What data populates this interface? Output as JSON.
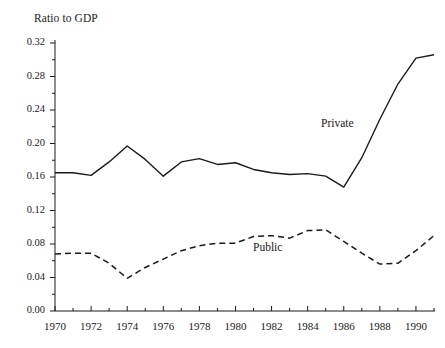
{
  "chart_data": {
    "type": "line",
    "title": "Ratio to GDP",
    "xlabel": "",
    "ylabel": "Ratio to GDP",
    "xlim": [
      1970,
      1991
    ],
    "ylim": [
      0.0,
      0.32
    ],
    "grid": false,
    "legend_position": "inline-annotations",
    "y_ticks": [
      "0.00",
      "0.04",
      "0.08",
      "0.12",
      "0.16",
      "0.20",
      "0.24",
      "0.28",
      "0.32"
    ],
    "y_tick_values": [
      0.0,
      0.04,
      0.08,
      0.12,
      0.16,
      0.2,
      0.24,
      0.28,
      0.32
    ],
    "y_minor_ticks": [
      0.02,
      0.06,
      0.1,
      0.14,
      0.18,
      0.22,
      0.26,
      0.3
    ],
    "x_ticks": [
      "1970",
      "1972",
      "1974",
      "1976",
      "1978",
      "1980",
      "1982",
      "1984",
      "1986",
      "1988",
      "1990"
    ],
    "x_tick_values": [
      1970,
      1972,
      1974,
      1976,
      1978,
      1980,
      1982,
      1984,
      1986,
      1988,
      1990
    ],
    "x_minor_ticks": [
      1971,
      1973,
      1975,
      1977,
      1979,
      1981,
      1983,
      1985,
      1987,
      1989,
      1991
    ],
    "x": [
      1970,
      1971,
      1972,
      1973,
      1974,
      1975,
      1976,
      1977,
      1978,
      1979,
      1980,
      1981,
      1982,
      1983,
      1984,
      1985,
      1986,
      1987,
      1988,
      1989,
      1990,
      1991
    ],
    "series": [
      {
        "name": "Private",
        "style": "solid",
        "color": "#1a1a1a",
        "annotation": "Private",
        "values": [
          0.165,
          0.165,
          0.162,
          0.178,
          0.197,
          0.181,
          0.161,
          0.178,
          0.182,
          0.175,
          0.177,
          0.169,
          0.165,
          0.163,
          0.164,
          0.161,
          0.148,
          0.183,
          0.229,
          0.271,
          0.302,
          0.306
        ]
      },
      {
        "name": "Public",
        "style": "dashed",
        "color": "#1a1a1a",
        "annotation": "Public",
        "values": [
          0.068,
          0.069,
          0.069,
          0.057,
          0.039,
          0.052,
          0.062,
          0.072,
          0.078,
          0.081,
          0.081,
          0.089,
          0.09,
          0.087,
          0.096,
          0.097,
          0.083,
          0.069,
          0.056,
          0.057,
          0.072,
          0.09
        ]
      }
    ]
  },
  "labels": {
    "axis_title": "Ratio to GDP",
    "private": "Private",
    "public": "Public"
  }
}
